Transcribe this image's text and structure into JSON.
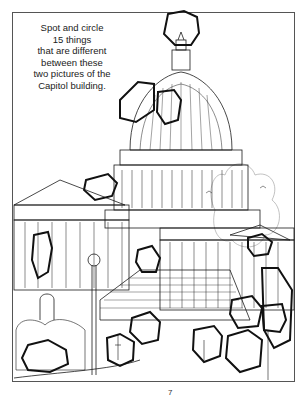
{
  "puzzle": {
    "instructions": [
      "Spot and circle",
      "15 things",
      "that are different",
      "between these",
      "two pictures of the",
      "Capitol building."
    ],
    "subject": "Capitol building",
    "differences_to_find": 15,
    "circled_count": 15,
    "page_number": "7"
  },
  "colors": {
    "line": "#1a1a1a",
    "circle": "#111111",
    "frame": "#555555",
    "background": "#ffffff"
  }
}
